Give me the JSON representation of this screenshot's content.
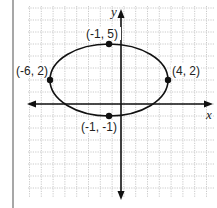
{
  "chart_data": {
    "type": "scatter",
    "title": "",
    "xlabel": "x",
    "ylabel": "y",
    "grid": true,
    "xlim": [
      -8,
      7
    ],
    "ylim": [
      -8,
      8
    ],
    "curve": {
      "shape": "ellipse",
      "center": [
        -1,
        2
      ],
      "semi_axis_x": 5,
      "semi_axis_y": 3
    },
    "points": [
      {
        "x": -1,
        "y": 5,
        "label": "(-1, 5)"
      },
      {
        "x": -6,
        "y": 2,
        "label": "(-6, 2)"
      },
      {
        "x": 4,
        "y": 2,
        "label": "(4, 2)"
      },
      {
        "x": -1,
        "y": -1,
        "label": "(-1, -1)"
      }
    ]
  },
  "labels": {
    "x_axis": "x",
    "y_axis": "y",
    "p_top": "(-1, 5)",
    "p_left": "(-6, 2)",
    "p_right": "(4, 2)",
    "p_bottom": "(-1, -1)"
  },
  "colors": {
    "grid": "#b8b8b8",
    "axis": "#111111",
    "curve": "#111111",
    "border": "#8a8a8a"
  }
}
